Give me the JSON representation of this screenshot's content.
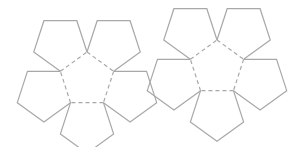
{
  "diagram": {
    "face_count": 12,
    "halves": [
      {
        "name": "left-flower",
        "center_face": "L0",
        "petals": [
          "L1",
          "L2",
          "L3",
          "L4",
          "L5"
        ]
      },
      {
        "name": "right-flower",
        "center_face": "R0",
        "petals": [
          "R1",
          "R2",
          "R3",
          "R4",
          "R5"
        ]
      }
    ],
    "edge_styles": {
      "cut": "solid",
      "fold": "dashed"
    },
    "colors": {
      "background": "#ffffff",
      "line": "#a8a8a8"
    }
  }
}
